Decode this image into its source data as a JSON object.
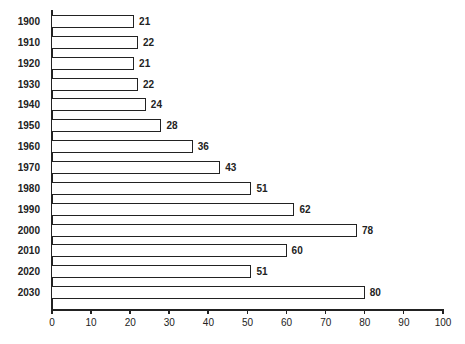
{
  "chart_data": {
    "type": "bar",
    "orientation": "horizontal",
    "title": "",
    "xlabel": "",
    "ylabel": "",
    "categories": [
      "1900",
      "1910",
      "1920",
      "1930",
      "1940",
      "1950",
      "1960",
      "1970",
      "1980",
      "1990",
      "2000",
      "2010",
      "2020",
      "2030"
    ],
    "values": [
      21,
      22,
      21,
      22,
      24,
      28,
      36,
      43,
      51,
      62,
      78,
      60,
      51,
      80
    ],
    "xlim": [
      0,
      100
    ],
    "x_ticks": [
      0,
      10,
      20,
      30,
      40,
      50,
      60,
      70,
      80,
      90,
      100
    ],
    "grid": false,
    "legend": null,
    "data_labels": true,
    "bar_fill": "#ffffff",
    "bar_edge": "#222222"
  }
}
